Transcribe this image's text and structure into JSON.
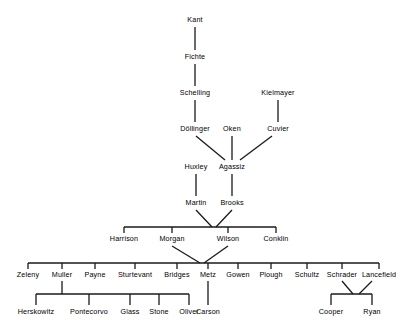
{
  "diagram": {
    "type": "tree",
    "stroke_color": "#1a1a1a",
    "background_color": "#ffffff",
    "text_color": "#000000",
    "generations": [
      {
        "level": 1,
        "nodes": [
          {
            "name": "Kant",
            "x": 195,
            "y": 20
          }
        ]
      },
      {
        "level": 2,
        "nodes": [
          {
            "name": "Fichte",
            "x": 195,
            "y": 57
          }
        ]
      },
      {
        "level": 3,
        "nodes": [
          {
            "name": "Schelling",
            "x": 195,
            "y": 93
          },
          {
            "name": "Kielmayer",
            "x": 278,
            "y": 93
          }
        ]
      },
      {
        "level": 4,
        "nodes": [
          {
            "name": "Döllinger",
            "x": 195,
            "y": 129
          },
          {
            "name": "Oken",
            "x": 232,
            "y": 129
          },
          {
            "name": "Cuvier",
            "x": 278,
            "y": 129
          }
        ]
      },
      {
        "level": 5,
        "nodes": [
          {
            "name": "Huxley",
            "x": 196,
            "y": 167
          },
          {
            "name": "Agassiz",
            "x": 232,
            "y": 167
          }
        ]
      },
      {
        "level": 6,
        "nodes": [
          {
            "name": "Martin",
            "x": 196,
            "y": 203
          },
          {
            "name": "Brooks",
            "x": 232,
            "y": 203
          }
        ]
      },
      {
        "level": 7,
        "nodes": [
          {
            "name": "Harrison",
            "x": 124,
            "y": 239
          },
          {
            "name": "Morgan",
            "x": 172,
            "y": 239
          },
          {
            "name": "Wilson",
            "x": 228,
            "y": 239
          },
          {
            "name": "Conklin",
            "x": 276,
            "y": 239
          }
        ]
      },
      {
        "level": 8,
        "nodes": [
          {
            "name": "Zeleny",
            "x": 28,
            "y": 275
          },
          {
            "name": "Muller",
            "x": 62,
            "y": 275
          },
          {
            "name": "Payne",
            "x": 95,
            "y": 275
          },
          {
            "name": "Sturtevant",
            "x": 135,
            "y": 275
          },
          {
            "name": "Bridges",
            "x": 177,
            "y": 275
          },
          {
            "name": "Metz",
            "x": 208,
            "y": 275
          },
          {
            "name": "Gowen",
            "x": 238,
            "y": 275
          },
          {
            "name": "Plough",
            "x": 271,
            "y": 275
          },
          {
            "name": "Schultz",
            "x": 307,
            "y": 275
          },
          {
            "name": "Schrader",
            "x": 342,
            "y": 275
          },
          {
            "name": "Lancefield",
            "x": 379,
            "y": 275
          }
        ]
      },
      {
        "level": 9,
        "nodes": [
          {
            "name": "Herskowitz",
            "x": 36,
            "y": 312
          },
          {
            "name": "Pontecorvo",
            "x": 89,
            "y": 312
          },
          {
            "name": "Glass",
            "x": 130,
            "y": 312
          },
          {
            "name": "Stone",
            "x": 159,
            "y": 312
          },
          {
            "name": "Oliver",
            "x": 189,
            "y": 312
          },
          {
            "name": "Carson",
            "x": 208,
            "y": 312
          },
          {
            "name": "Cooper",
            "x": 331,
            "y": 312
          },
          {
            "name": "Ryan",
            "x": 372,
            "y": 312
          }
        ]
      }
    ],
    "edges": [
      {
        "from": "Kant",
        "to": "Fichte"
      },
      {
        "from": "Fichte",
        "to": "Schelling"
      },
      {
        "from": "Schelling",
        "to": "Döllinger"
      },
      {
        "from": "Kielmayer",
        "to": "Cuvier"
      },
      {
        "from": "Döllinger",
        "to": "Agassiz"
      },
      {
        "from": "Oken",
        "to": "Agassiz"
      },
      {
        "from": "Cuvier",
        "to": "Agassiz"
      },
      {
        "from": "Huxley",
        "to": "Martin"
      },
      {
        "from": "Agassiz",
        "to": "Brooks"
      },
      {
        "from": "Martin",
        "to": "Harrison"
      },
      {
        "from": "Martin",
        "to": "Morgan"
      },
      {
        "from": "Martin",
        "to": "Wilson"
      },
      {
        "from": "Martin",
        "to": "Conklin"
      },
      {
        "from": "Brooks",
        "to": "Harrison"
      },
      {
        "from": "Brooks",
        "to": "Morgan"
      },
      {
        "from": "Brooks",
        "to": "Wilson"
      },
      {
        "from": "Brooks",
        "to": "Conklin"
      },
      {
        "from": "Morgan",
        "to": "Zeleny"
      },
      {
        "from": "Morgan",
        "to": "Muller"
      },
      {
        "from": "Morgan",
        "to": "Payne"
      },
      {
        "from": "Morgan",
        "to": "Sturtevant"
      },
      {
        "from": "Morgan",
        "to": "Bridges"
      },
      {
        "from": "Morgan",
        "to": "Metz"
      },
      {
        "from": "Morgan",
        "to": "Gowen"
      },
      {
        "from": "Morgan",
        "to": "Plough"
      },
      {
        "from": "Morgan",
        "to": "Schultz"
      },
      {
        "from": "Morgan",
        "to": "Schrader"
      },
      {
        "from": "Morgan",
        "to": "Lancefield"
      },
      {
        "from": "Wilson",
        "to": "Zeleny"
      },
      {
        "from": "Wilson",
        "to": "Muller"
      },
      {
        "from": "Wilson",
        "to": "Payne"
      },
      {
        "from": "Wilson",
        "to": "Sturtevant"
      },
      {
        "from": "Wilson",
        "to": "Bridges"
      },
      {
        "from": "Wilson",
        "to": "Metz"
      },
      {
        "from": "Wilson",
        "to": "Gowen"
      },
      {
        "from": "Wilson",
        "to": "Plough"
      },
      {
        "from": "Wilson",
        "to": "Schultz"
      },
      {
        "from": "Wilson",
        "to": "Schrader"
      },
      {
        "from": "Wilson",
        "to": "Lancefield"
      },
      {
        "from": "Muller",
        "to": "Herskowitz"
      },
      {
        "from": "Muller",
        "to": "Pontecorvo"
      },
      {
        "from": "Muller",
        "to": "Glass"
      },
      {
        "from": "Muller",
        "to": "Stone"
      },
      {
        "from": "Muller",
        "to": "Oliver"
      },
      {
        "from": "Metz",
        "to": "Carson"
      },
      {
        "from": "Schrader",
        "to": "Cooper"
      },
      {
        "from": "Schrader",
        "to": "Ryan"
      },
      {
        "from": "Lancefield",
        "to": "Cooper"
      },
      {
        "from": "Lancefield",
        "to": "Ryan"
      }
    ]
  }
}
